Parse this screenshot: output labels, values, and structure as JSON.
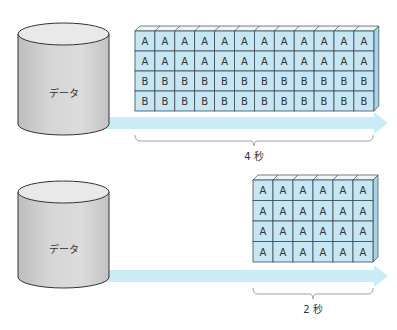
{
  "panels": [
    {
      "cylinder_label": "データ",
      "grid": {
        "rows": [
          [
            "A",
            "A",
            "A",
            "A",
            "A",
            "A",
            "A",
            "A",
            "A",
            "A",
            "A",
            "A"
          ],
          [
            "A",
            "A",
            "A",
            "A",
            "A",
            "A",
            "A",
            "A",
            "A",
            "A",
            "A",
            "A"
          ],
          [
            "B",
            "B",
            "B",
            "B",
            "B",
            "B",
            "B",
            "B",
            "B",
            "B",
            "B",
            "B"
          ],
          [
            "B",
            "B",
            "B",
            "B",
            "B",
            "B",
            "B",
            "B",
            "B",
            "B",
            "B",
            "B"
          ]
        ]
      },
      "duration_label": "4 秒"
    },
    {
      "cylinder_label": "データ",
      "grid": {
        "rows": [
          [
            "A",
            "A",
            "A",
            "A",
            "A",
            "A"
          ],
          [
            "A",
            "A",
            "A",
            "A",
            "A",
            "A"
          ],
          [
            "A",
            "A",
            "A",
            "A",
            "A",
            "A"
          ],
          [
            "A",
            "A",
            "A",
            "A",
            "A",
            "A"
          ]
        ]
      },
      "duration_label": "2 秒"
    }
  ],
  "colors": {
    "cell_fill": "#c7e6f3",
    "cell_stroke": "#3a4a55",
    "arrow": "#c9ecf6",
    "cylinder_body": "#cfcfcf",
    "cylinder_top": "#e8e8e8"
  }
}
